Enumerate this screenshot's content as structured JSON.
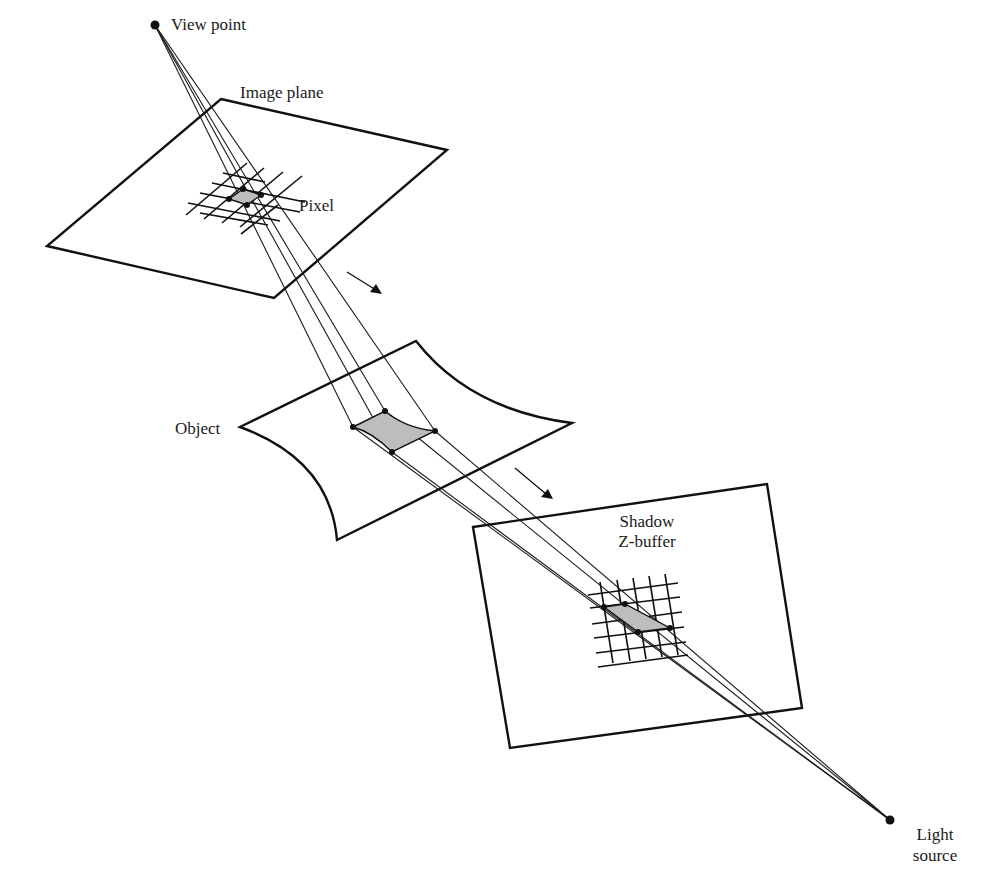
{
  "diagram": {
    "labels": {
      "view_point": "View point",
      "image_plane": "Image plane",
      "pixel": "Pixel",
      "object": "Object",
      "shadow_line1": "Shadow",
      "shadow_line2": "Z-buffer",
      "light_line1": "Light",
      "light_line2": "source"
    },
    "points": {
      "view_point": [
        155,
        25
      ],
      "light_source": [
        890,
        820
      ]
    },
    "image_plane": {
      "corners": [
        [
          221,
          99
        ],
        [
          447,
          150
        ],
        [
          274,
          298
        ],
        [
          47,
          246
        ]
      ]
    },
    "object": {
      "corners": [
        [
          416,
          341
        ],
        [
          572,
          423
        ],
        [
          337,
          540
        ],
        [
          240,
          427
        ]
      ]
    },
    "shadow_zbuffer": {
      "corners": [
        [
          473,
          527
        ],
        [
          767,
          484
        ],
        [
          802,
          708
        ],
        [
          510,
          748
        ]
      ]
    },
    "pixel_samples": [
      [
        243,
        189
      ],
      [
        261,
        195
      ],
      [
        229,
        199
      ],
      [
        247,
        205
      ]
    ],
    "object_samples": [
      [
        353,
        427
      ],
      [
        385,
        411
      ],
      [
        435,
        431
      ],
      [
        392,
        452
      ]
    ],
    "shadow_samples": [
      [
        604,
        607
      ],
      [
        625,
        604
      ],
      [
        638,
        632
      ],
      [
        670,
        628
      ]
    ],
    "colors": {
      "line": "#111111",
      "fill_patch": "#bdbdbd",
      "background": "#ffffff"
    }
  }
}
